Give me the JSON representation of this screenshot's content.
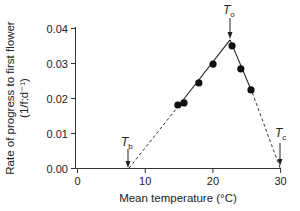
{
  "chart_data": {
    "type": "scatter",
    "title": "",
    "xlabel": "Mean temperature (°C)",
    "ylabel": "Rate of progress to first flower",
    "ylabel_units": "(1/f:d⁻¹)",
    "xlim": [
      0,
      30
    ],
    "ylim": [
      0,
      0.04
    ],
    "x_ticks": [
      0,
      10,
      20,
      30
    ],
    "x_tick_labels": [
      "0",
      "10",
      "20",
      "30"
    ],
    "y_ticks": [
      0.0,
      0.01,
      0.02,
      0.03,
      0.04
    ],
    "y_tick_labels": [
      "0.00",
      "0.01",
      "0.02",
      "0.03",
      "0.04"
    ],
    "grid": false,
    "legend": null,
    "series": [
      {
        "name": "observed",
        "style": "filled-circle",
        "x": [
          14.9,
          15.8,
          18.0,
          20.1,
          22.9,
          24.2,
          25.7
        ],
        "y": [
          0.018,
          0.0186,
          0.0243,
          0.0297,
          0.0349,
          0.0283,
          0.0223
        ]
      },
      {
        "name": "fitted-rising",
        "style": "solid-line",
        "x": [
          14.9,
          22.6
        ],
        "y": [
          0.0175,
          0.0366
        ]
      },
      {
        "name": "fitted-falling",
        "style": "solid-line",
        "x": [
          22.6,
          25.9
        ],
        "y": [
          0.0366,
          0.0215
        ]
      },
      {
        "name": "extrapolated-rising",
        "style": "dashed-line",
        "x": [
          7.7,
          14.9
        ],
        "y": [
          0.0,
          0.0175
        ]
      },
      {
        "name": "extrapolated-falling",
        "style": "dashed-line",
        "x": [
          25.9,
          30.0
        ],
        "y": [
          0.0215,
          0.0
        ]
      }
    ],
    "annotations": [
      {
        "label": "T",
        "subscript": "b",
        "meaning": "base temperature",
        "x": 7.7,
        "y": 0.0
      },
      {
        "label": "T",
        "subscript": "o",
        "meaning": "optimum temperature",
        "x": 22.6,
        "y": 0.0366
      },
      {
        "label": "T",
        "subscript": "c",
        "meaning": "ceiling temperature",
        "x": 30.0,
        "y": 0.0
      }
    ]
  },
  "labels": {
    "ylabel_line1": "Rate of progress to first flower",
    "ylabel_line2": "(1/f:d⁻¹)",
    "xlabel": "Mean temperature (°C)",
    "tb_main": "T",
    "tb_sub": "b",
    "to_main": "T",
    "to_sub": "o",
    "tc_main": "T",
    "tc_sub": "c"
  },
  "colors": {
    "axis": "#333333",
    "points": "#111111",
    "background": "#ffffff"
  }
}
